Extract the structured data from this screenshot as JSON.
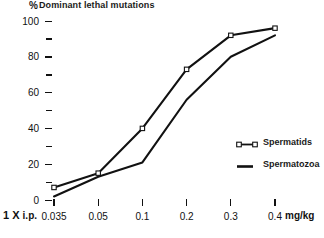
{
  "chart_data": {
    "type": "line",
    "title_symbol": "%",
    "title_text": "Dominant  lethal mutations",
    "xlabel": "",
    "ylabel": "",
    "xunit": "mg/kg",
    "x_prefix_bold": "1 X",
    "x_prefix_rest": "i.p.",
    "categories": [
      "0.035",
      "0.05",
      "0.1",
      "0.2",
      "0.3",
      "0.4"
    ],
    "x_values": [
      0.035,
      0.05,
      0.1,
      0.2,
      0.3,
      0.4
    ],
    "ylim": [
      0,
      100
    ],
    "y_ticks": [
      0,
      20,
      40,
      60,
      80,
      100
    ],
    "y_tick_labels": [
      "0",
      "20",
      "40",
      "60",
      "80",
      "100"
    ],
    "y_minor_ticks": [
      10,
      30,
      50,
      70,
      90
    ],
    "grid": false,
    "legend_position": "right",
    "series": [
      {
        "name": "Spermatids",
        "marker": "open-square",
        "values": [
          7,
          15,
          40,
          73,
          92,
          96
        ]
      },
      {
        "name": "Spermatozoa",
        "marker": "none",
        "values": [
          2,
          13,
          21,
          56,
          80,
          92
        ]
      }
    ],
    "colors": {
      "line": "#111111",
      "marker_fill": "#ffffff",
      "text": "#111111",
      "background": "#ffffff"
    }
  },
  "legend": {
    "items": [
      {
        "label": "Spermatids"
      },
      {
        "label": "Spermatozoa"
      }
    ]
  }
}
